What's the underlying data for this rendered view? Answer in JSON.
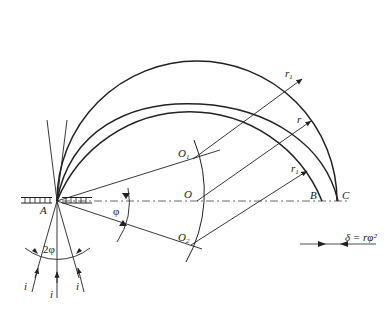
{
  "diagram": {
    "points": {
      "A": "A",
      "B": "B",
      "C": "C",
      "O": "O",
      "O1": "O",
      "O1_sub": "1",
      "O2": "O",
      "O2_sub": "2"
    },
    "radii": {
      "r1_top": "r",
      "r1_top_sub": "1",
      "r_mid": "r",
      "r1_bottom": "r",
      "r1_bottom_sub": "1"
    },
    "angles": {
      "phi": "φ",
      "two_phi": "2φ"
    },
    "rays": [
      "i",
      "i",
      "i"
    ],
    "formula": "δ = rφ²",
    "colors": {
      "stroke": "#222222",
      "background": "#ffffff"
    }
  }
}
